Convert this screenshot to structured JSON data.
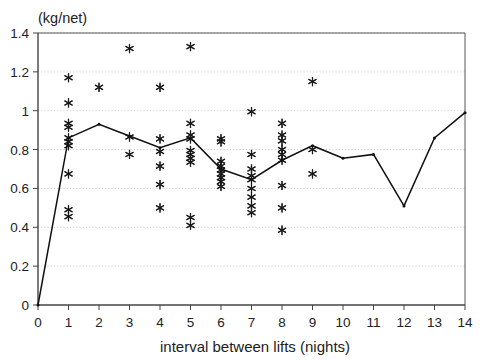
{
  "chart_data": {
    "type": "scatter",
    "title": "",
    "unit_label": "(kg/net)",
    "xlabel": "interval between lifts (nights)",
    "ylabel": "",
    "xlim": [
      0,
      14
    ],
    "ylim": [
      0,
      1.4
    ],
    "xticks": [
      0,
      1,
      2,
      3,
      4,
      5,
      6,
      7,
      8,
      9,
      10,
      11,
      12,
      13,
      14
    ],
    "xticklabels": [
      "0",
      "1",
      "2",
      "3",
      "4",
      "5",
      "6",
      "7",
      "8",
      "9",
      "10",
      "11",
      "12",
      "13",
      "14"
    ],
    "yticks": [
      0,
      0.2,
      0.4,
      0.6,
      0.8,
      1,
      1.2,
      1.4
    ],
    "yticklabels": [
      "0",
      "0.2",
      "0.4",
      "0.6",
      "0.8",
      "1",
      "1.2",
      "1.4"
    ],
    "grid": "horizontal-dotted",
    "grid_color": "#b9b9b9",
    "legend": "none",
    "axis_color": "#444444",
    "marker_color": "#1a1a1a",
    "line_color": "#111111",
    "series": [
      {
        "name": "mean catch per net",
        "type": "line",
        "marker": "small-dot",
        "x": [
          0,
          1,
          2,
          3,
          4,
          5,
          6,
          7,
          8,
          9,
          10,
          11,
          12,
          13,
          14
        ],
        "values": [
          0.0,
          0.86,
          0.93,
          0.87,
          0.81,
          0.86,
          0.7,
          0.645,
          0.745,
          0.82,
          0.755,
          0.775,
          0.51,
          0.86,
          0.99
        ]
      },
      {
        "name": "individual observations",
        "type": "scatter",
        "marker": "asterisk",
        "points": [
          {
            "x": 1,
            "y": 1.17
          },
          {
            "x": 1,
            "y": 1.04
          },
          {
            "x": 1,
            "y": 0.935
          },
          {
            "x": 1,
            "y": 0.915
          },
          {
            "x": 1,
            "y": 0.86
          },
          {
            "x": 1,
            "y": 0.84
          },
          {
            "x": 1,
            "y": 0.82
          },
          {
            "x": 1,
            "y": 0.675
          },
          {
            "x": 1,
            "y": 0.49
          },
          {
            "x": 1,
            "y": 0.455
          },
          {
            "x": 2,
            "y": 1.12
          },
          {
            "x": 3,
            "y": 1.32
          },
          {
            "x": 3,
            "y": 0.865
          },
          {
            "x": 3,
            "y": 0.775
          },
          {
            "x": 4,
            "y": 1.12
          },
          {
            "x": 4,
            "y": 0.855
          },
          {
            "x": 4,
            "y": 0.79
          },
          {
            "x": 4,
            "y": 0.715
          },
          {
            "x": 4,
            "y": 0.62
          },
          {
            "x": 4,
            "y": 0.5
          },
          {
            "x": 5,
            "y": 1.33
          },
          {
            "x": 5,
            "y": 0.935
          },
          {
            "x": 5,
            "y": 0.875
          },
          {
            "x": 5,
            "y": 0.855
          },
          {
            "x": 5,
            "y": 0.795
          },
          {
            "x": 5,
            "y": 0.775
          },
          {
            "x": 5,
            "y": 0.755
          },
          {
            "x": 5,
            "y": 0.735
          },
          {
            "x": 5,
            "y": 0.45
          },
          {
            "x": 5,
            "y": 0.41
          },
          {
            "x": 6,
            "y": 0.855
          },
          {
            "x": 6,
            "y": 0.84
          },
          {
            "x": 6,
            "y": 0.74
          },
          {
            "x": 6,
            "y": 0.715
          },
          {
            "x": 6,
            "y": 0.695
          },
          {
            "x": 6,
            "y": 0.675
          },
          {
            "x": 6,
            "y": 0.655
          },
          {
            "x": 6,
            "y": 0.635
          },
          {
            "x": 6,
            "y": 0.61
          },
          {
            "x": 7,
            "y": 0.995
          },
          {
            "x": 7,
            "y": 0.775
          },
          {
            "x": 7,
            "y": 0.7
          },
          {
            "x": 7,
            "y": 0.665
          },
          {
            "x": 7,
            "y": 0.645
          },
          {
            "x": 7,
            "y": 0.6
          },
          {
            "x": 7,
            "y": 0.555
          },
          {
            "x": 7,
            "y": 0.51
          },
          {
            "x": 7,
            "y": 0.475
          },
          {
            "x": 8,
            "y": 0.935
          },
          {
            "x": 8,
            "y": 0.875
          },
          {
            "x": 8,
            "y": 0.845
          },
          {
            "x": 8,
            "y": 0.8
          },
          {
            "x": 8,
            "y": 0.775
          },
          {
            "x": 8,
            "y": 0.745
          },
          {
            "x": 8,
            "y": 0.615
          },
          {
            "x": 8,
            "y": 0.5
          },
          {
            "x": 8,
            "y": 0.385
          },
          {
            "x": 9,
            "y": 1.15
          },
          {
            "x": 9,
            "y": 0.8
          },
          {
            "x": 9,
            "y": 0.675
          }
        ]
      }
    ]
  }
}
